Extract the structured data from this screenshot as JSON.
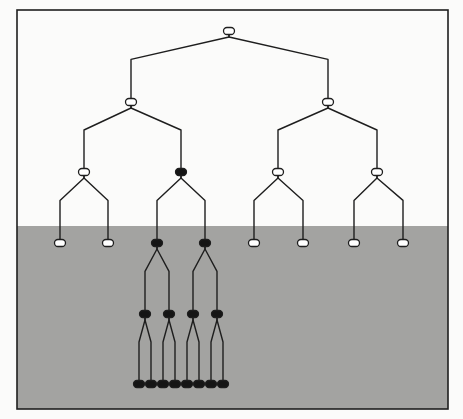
{
  "diagram": {
    "type": "binary-tree",
    "frame": {
      "x": 17,
      "y": 10,
      "w": 431,
      "h": 399
    },
    "shaded_region_top": 226,
    "colors": {
      "background": "#fbfbfa",
      "shade": "#a3a3a1",
      "line": "#1e1e1e",
      "node_open_fill": "#ffffff",
      "node_filled": "#151515"
    },
    "nodes": [
      {
        "id": "n0",
        "x": 229,
        "y": 31,
        "filled": false
      },
      {
        "id": "n1",
        "x": 131,
        "y": 102,
        "filled": false
      },
      {
        "id": "n2",
        "x": 328,
        "y": 102,
        "filled": false
      },
      {
        "id": "n3",
        "x": 84,
        "y": 172,
        "filled": false
      },
      {
        "id": "n4",
        "x": 181,
        "y": 172,
        "filled": true
      },
      {
        "id": "n5",
        "x": 278,
        "y": 172,
        "filled": false
      },
      {
        "id": "n6",
        "x": 377,
        "y": 172,
        "filled": false
      },
      {
        "id": "n7",
        "x": 60,
        "y": 243,
        "filled": false
      },
      {
        "id": "n8",
        "x": 108,
        "y": 243,
        "filled": false
      },
      {
        "id": "n9",
        "x": 157,
        "y": 243,
        "filled": true
      },
      {
        "id": "n10",
        "x": 205,
        "y": 243,
        "filled": true
      },
      {
        "id": "n11",
        "x": 254,
        "y": 243,
        "filled": false
      },
      {
        "id": "n12",
        "x": 303,
        "y": 243,
        "filled": false
      },
      {
        "id": "n13",
        "x": 354,
        "y": 243,
        "filled": false
      },
      {
        "id": "n14",
        "x": 403,
        "y": 243,
        "filled": false
      },
      {
        "id": "n15",
        "x": 145,
        "y": 314,
        "filled": true
      },
      {
        "id": "n16",
        "x": 169,
        "y": 314,
        "filled": true
      },
      {
        "id": "n17",
        "x": 193,
        "y": 314,
        "filled": true
      },
      {
        "id": "n18",
        "x": 217,
        "y": 314,
        "filled": true
      },
      {
        "id": "n19",
        "x": 139,
        "y": 384,
        "filled": true
      },
      {
        "id": "n20",
        "x": 151,
        "y": 384,
        "filled": true
      },
      {
        "id": "n21",
        "x": 163,
        "y": 384,
        "filled": true
      },
      {
        "id": "n22",
        "x": 175,
        "y": 384,
        "filled": true
      },
      {
        "id": "n23",
        "x": 187,
        "y": 384,
        "filled": true
      },
      {
        "id": "n24",
        "x": 199,
        "y": 384,
        "filled": true
      },
      {
        "id": "n25",
        "x": 211,
        "y": 384,
        "filled": true
      },
      {
        "id": "n26",
        "x": 223,
        "y": 384,
        "filled": true
      }
    ],
    "edges": [
      [
        "n0",
        "n1"
      ],
      [
        "n0",
        "n2"
      ],
      [
        "n1",
        "n3"
      ],
      [
        "n1",
        "n4"
      ],
      [
        "n2",
        "n5"
      ],
      [
        "n2",
        "n6"
      ],
      [
        "n3",
        "n7"
      ],
      [
        "n3",
        "n8"
      ],
      [
        "n4",
        "n9"
      ],
      [
        "n4",
        "n10"
      ],
      [
        "n5",
        "n11"
      ],
      [
        "n5",
        "n12"
      ],
      [
        "n6",
        "n13"
      ],
      [
        "n6",
        "n14"
      ],
      [
        "n9",
        "n15"
      ],
      [
        "n9",
        "n16"
      ],
      [
        "n10",
        "n17"
      ],
      [
        "n10",
        "n18"
      ],
      [
        "n15",
        "n19"
      ],
      [
        "n15",
        "n20"
      ],
      [
        "n16",
        "n21"
      ],
      [
        "n16",
        "n22"
      ],
      [
        "n17",
        "n23"
      ],
      [
        "n17",
        "n24"
      ],
      [
        "n18",
        "n25"
      ],
      [
        "n18",
        "n26"
      ]
    ]
  }
}
